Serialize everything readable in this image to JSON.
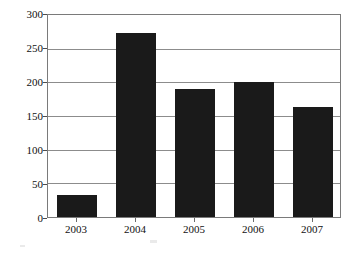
{
  "chart_data": {
    "type": "bar",
    "title": "",
    "subtitle": "",
    "xlabel": "",
    "ylabel": "",
    "categories": [
      "2003",
      "2004",
      "2005",
      "2006",
      "2007"
    ],
    "values": [
      33,
      274,
      190,
      201,
      164
    ],
    "series": [
      {
        "name": "",
        "values": [
          33,
          274,
          190,
          201,
          164
        ]
      }
    ],
    "ylim": [
      0,
      300
    ],
    "yticks": [
      0,
      50,
      100,
      150,
      200,
      250,
      300
    ],
    "ytick_labels": [
      "0",
      "50",
      "100",
      "150",
      "200",
      "250",
      "300"
    ],
    "xtick_labels": [
      "2003",
      "2004",
      "2005",
      "2006",
      "2007"
    ],
    "grid": true,
    "grid_axis": "y",
    "legend": false,
    "legend_position": "none",
    "bar_color": "#1a1a1a",
    "plot_border_color": "#7a7a7a",
    "gridline_color": "#8c8c8c",
    "background_color": "#ffffff",
    "annotations": []
  }
}
